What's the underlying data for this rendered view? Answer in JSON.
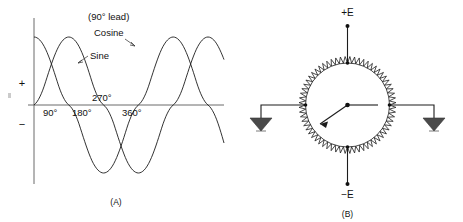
{
  "figure_a": {
    "caption": "(A)",
    "annotations": {
      "lead_note": "(90° lead)",
      "cosine_label": "Cosine",
      "sine_label": "Sine"
    },
    "axis": {
      "positive_sign": "+",
      "negative_sign": "−",
      "tick_labels": [
        "90°",
        "180°",
        "270°",
        "360°"
      ]
    }
  },
  "figure_b": {
    "caption": "(B)",
    "terminals": {
      "top": "+E",
      "bottom": "−E"
    },
    "component": "circular-potentiometer-ring",
    "ground_count": 2
  },
  "chart_data": {
    "type": "line",
    "title": "",
    "xlabel": "",
    "ylabel": "",
    "xlim": [
      0,
      810
    ],
    "ylim": [
      -1.15,
      1.15
    ],
    "grid": false,
    "legend": "inline-annotation",
    "x": [
      0,
      90,
      180,
      270,
      360,
      450,
      540,
      630,
      720,
      810
    ],
    "series": [
      {
        "name": "Sine",
        "phase_deg": 0,
        "values": [
          0,
          1,
          0,
          -1,
          0,
          1,
          0,
          -1,
          0,
          1
        ]
      },
      {
        "name": "Cosine",
        "phase_deg": 90,
        "values": [
          1,
          0,
          -1,
          0,
          1,
          0,
          -1,
          0,
          1,
          0
        ]
      }
    ],
    "annotations": [
      "(90° lead)",
      "Cosine",
      "Sine"
    ],
    "tick_labels": [
      "90°",
      "180°",
      "270°",
      "360°"
    ],
    "tick_values": [
      90,
      180,
      270,
      360
    ]
  }
}
